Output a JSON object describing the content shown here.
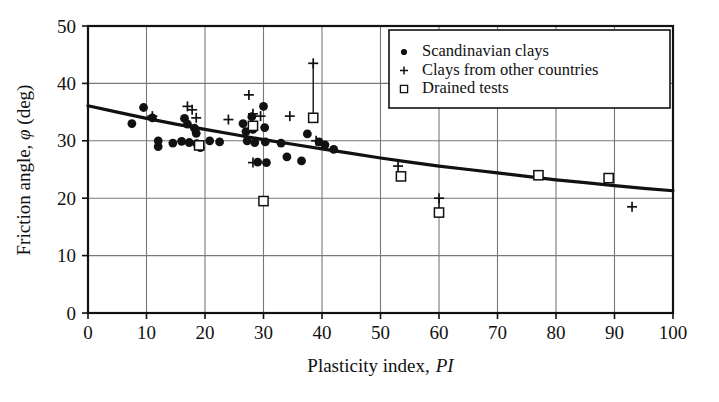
{
  "chart_data": {
    "type": "scatter",
    "title": "",
    "xlabel": "Plasticity index, PI",
    "xlabel_plain": "Plasticity index,",
    "xlabel_italic": "PI",
    "ylabel": "Friction angle, φ (deg)",
    "ylabel_pre": "Friction angle,",
    "ylabel_symbol": "φ",
    "ylabel_post": "(deg)",
    "xlim": [
      0,
      100
    ],
    "ylim": [
      0,
      50
    ],
    "xticks": [
      0,
      10,
      20,
      30,
      40,
      50,
      60,
      70,
      80,
      90,
      100
    ],
    "yticks": [
      0,
      10,
      20,
      30,
      40,
      50
    ],
    "grid": true,
    "grid_color": "#777777",
    "frame_color": "#111111",
    "legend_position": "top-right",
    "legend": [
      {
        "marker": "circle",
        "label": "Scandinavian clays"
      },
      {
        "marker": "plus",
        "label": "Clays from other countries"
      },
      {
        "marker": "square",
        "label": "Drained tests"
      }
    ],
    "series": [
      {
        "name": "Scandinavian clays",
        "marker": "circle",
        "color": "#111111",
        "points": [
          [
            7.5,
            33.0
          ],
          [
            9.5,
            35.8
          ],
          [
            11.0,
            34.0
          ],
          [
            12.0,
            30.0
          ],
          [
            12.0,
            29.0
          ],
          [
            14.5,
            29.6
          ],
          [
            16.0,
            29.9
          ],
          [
            16.5,
            33.9
          ],
          [
            17.0,
            32.9
          ],
          [
            17.3,
            29.7
          ],
          [
            18.2,
            32.2
          ],
          [
            18.5,
            31.3
          ],
          [
            18.6,
            29.5
          ],
          [
            19.0,
            29.0
          ],
          [
            19.2,
            28.8
          ],
          [
            20.8,
            30.0
          ],
          [
            22.5,
            29.8
          ],
          [
            26.5,
            33.0
          ],
          [
            27.0,
            31.6
          ],
          [
            27.2,
            30.0
          ],
          [
            28.0,
            34.2
          ],
          [
            28.2,
            32.0
          ],
          [
            28.5,
            29.7
          ],
          [
            29.0,
            26.3
          ],
          [
            30.0,
            36.0
          ],
          [
            30.2,
            32.3
          ],
          [
            30.3,
            29.8
          ],
          [
            30.5,
            26.2
          ],
          [
            33.0,
            29.6
          ],
          [
            34.0,
            27.2
          ],
          [
            36.5,
            26.5
          ],
          [
            37.5,
            31.2
          ],
          [
            39.5,
            29.8
          ],
          [
            40.5,
            29.3
          ],
          [
            42.0,
            28.5
          ]
        ]
      },
      {
        "name": "Clays from other countries",
        "marker": "plus",
        "color": "#111111",
        "points": [
          [
            11.0,
            34.3
          ],
          [
            17.0,
            36.0
          ],
          [
            17.8,
            35.4
          ],
          [
            18.5,
            34.0
          ],
          [
            24.0,
            33.7
          ],
          [
            27.5,
            38.0
          ],
          [
            28.2,
            34.7
          ],
          [
            29.5,
            34.3
          ],
          [
            28.2,
            26.2
          ],
          [
            34.5,
            34.3
          ],
          [
            38.5,
            43.5
          ],
          [
            39.0,
            30.0
          ],
          [
            53.0,
            25.6
          ],
          [
            60.0,
            20.0
          ],
          [
            93.0,
            18.5
          ]
        ]
      },
      {
        "name": "Drained tests",
        "marker": "square",
        "color": "#111111",
        "points": [
          [
            19.0,
            29.2
          ],
          [
            28.2,
            32.6
          ],
          [
            30.0,
            19.5
          ],
          [
            38.5,
            34.0
          ],
          [
            53.5,
            23.8
          ],
          [
            60.0,
            17.5
          ],
          [
            77.0,
            24.0
          ],
          [
            89.0,
            23.5
          ]
        ]
      }
    ],
    "connectors": [
      {
        "x": 38.5,
        "y1": 43.5,
        "y2": 34.0
      },
      {
        "x": 60.0,
        "y1": 20.0,
        "y2": 17.5
      }
    ],
    "trend_curve": {
      "name": "best-fit trend",
      "color": "#111111",
      "width": 3.2,
      "points": [
        [
          0,
          36.1
        ],
        [
          5,
          35.0
        ],
        [
          10,
          33.9
        ],
        [
          15,
          32.9
        ],
        [
          20,
          32.0
        ],
        [
          25,
          31.1
        ],
        [
          30,
          30.2
        ],
        [
          35,
          29.4
        ],
        [
          40,
          28.6
        ],
        [
          45,
          27.8
        ],
        [
          50,
          27.0
        ],
        [
          55,
          26.3
        ],
        [
          60,
          25.6
        ],
        [
          65,
          25.0
        ],
        [
          70,
          24.4
        ],
        [
          75,
          23.8
        ],
        [
          80,
          23.2
        ],
        [
          85,
          22.7
        ],
        [
          90,
          22.2
        ],
        [
          95,
          21.7
        ],
        [
          100,
          21.3
        ]
      ]
    }
  }
}
